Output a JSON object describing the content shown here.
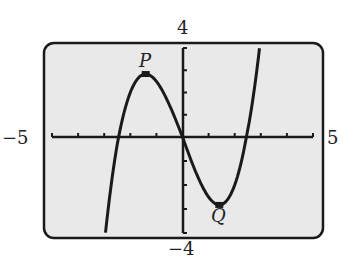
{
  "chart_data": {
    "type": "line",
    "title": "",
    "xlabel": "",
    "ylabel": "",
    "xlim": [
      -5,
      5
    ],
    "ylim": [
      -4,
      4
    ],
    "x_tick_step": 1,
    "y_tick_step": 1,
    "function": "y = 0.5*(x^3 - 6x)",
    "points": [
      {
        "name": "P",
        "x": -1.41,
        "y": 2.83
      },
      {
        "name": "Q",
        "x": 1.41,
        "y": -2.83
      }
    ],
    "axis_labels": {
      "xmin": "−5",
      "xmax": "5",
      "ymax": "4",
      "ymin": "−4"
    }
  },
  "colors": {
    "screen": "#e9e9e9",
    "ink": "#1a1a1a"
  }
}
